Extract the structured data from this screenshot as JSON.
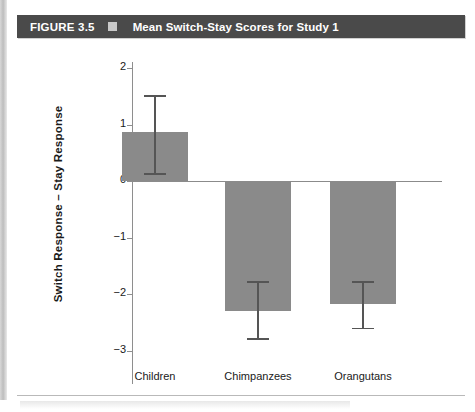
{
  "figure": {
    "number": "FIGURE 3.5",
    "marker_icon": "square-marker-icon",
    "title": "Mean Switch-Stay Scores for Study 1",
    "header_bg": "#4a4a4a",
    "header_text_color": "#ffffff"
  },
  "chart_data": {
    "type": "bar",
    "title": "Mean Switch-Stay Scores for Study 1",
    "xlabel": "",
    "ylabel": "Switch Response – Stay Response",
    "categories": [
      "Children",
      "Chimpanzees",
      "Orangutans"
    ],
    "values": [
      0.87,
      -2.3,
      -2.17
    ],
    "error_bars": {
      "upper": [
        1.52,
        -1.77,
        -1.77
      ],
      "lower": [
        0.14,
        -2.78,
        -2.6
      ]
    },
    "yticks": [
      2,
      1,
      0,
      -1,
      -2,
      -3
    ],
    "ytick_labels": [
      "2",
      "1",
      "0",
      "−1",
      "−2",
      "−3"
    ],
    "ylim": [
      -3.0,
      2.0
    ],
    "grid": false,
    "legend": null,
    "bar_color": "#8a8a8a",
    "axis_color": "#8e8e8e",
    "error_bar_color": "#555555"
  }
}
